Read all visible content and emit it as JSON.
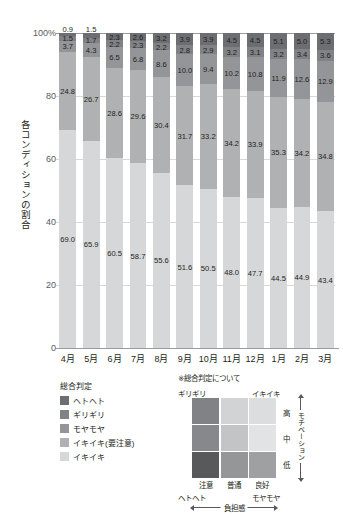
{
  "chart_data": {
    "type": "bar",
    "stacked": true,
    "stack_mode": "percent",
    "title": "",
    "xlabel": "",
    "ylabel": "各コンディションの割合",
    "ylim": [
      0,
      100
    ],
    "yticks": [
      "0",
      "20",
      "40",
      "60",
      "80",
      "100%"
    ],
    "grid": true,
    "legend_position": "below-left",
    "legend_title": "総合判定",
    "categories": [
      "4月",
      "5月",
      "6月",
      "7月",
      "8月",
      "9月",
      "10月",
      "11月",
      "12月",
      "1月",
      "2月",
      "3月"
    ],
    "series": [
      {
        "name": "ヘトヘト",
        "color": "#6d6e71",
        "values": [
          0.9,
          1.5,
          2.3,
          2.6,
          3.2,
          3.9,
          3.9,
          4.5,
          4.5,
          5.1,
          5.0,
          5.3
        ]
      },
      {
        "name": "ギリギリ",
        "color": "#808285",
        "values": [
          1.5,
          1.7,
          2.2,
          2.3,
          2.2,
          2.8,
          2.9,
          3.2,
          3.1,
          3.2,
          3.4,
          3.6
        ]
      },
      {
        "name": "モヤモヤ",
        "color": "#949598",
        "values": [
          3.7,
          4.3,
          6.5,
          6.8,
          8.6,
          10.0,
          9.4,
          10.2,
          10.8,
          11.9,
          12.6,
          12.9
        ]
      },
      {
        "name": "イキイキ(要注意)",
        "color": "#b0b1b3",
        "values": [
          24.8,
          26.7,
          28.6,
          29.6,
          30.4,
          31.7,
          33.2,
          34.2,
          33.9,
          35.3,
          34.2,
          34.8
        ]
      },
      {
        "name": "イキイキ",
        "color": "#d6d7d8",
        "values": [
          69.0,
          65.9,
          60.5,
          58.7,
          55.6,
          51.6,
          50.5,
          48.0,
          47.7,
          44.5,
          44.9,
          43.4
        ]
      }
    ]
  },
  "legend": {
    "title": "総合判定",
    "items": [
      {
        "label": "ヘトヘト",
        "color": "#6d6e71"
      },
      {
        "label": "ギリギリ",
        "color": "#808285"
      },
      {
        "label": "モヤモヤ",
        "color": "#949598"
      },
      {
        "label": "イキイキ(要注意)",
        "color": "#b0b1b3"
      },
      {
        "label": "イキイキ",
        "color": "#d6d7d8"
      }
    ]
  },
  "matrix": {
    "note": "※総合判定について",
    "corner_top_left": "ギリギリ",
    "corner_top_right": "イキイキ",
    "corner_bottom_left": "ヘトヘト",
    "corner_bottom_right": "モヤモヤ",
    "column_labels": [
      "注意",
      "普通",
      "良好"
    ],
    "row_labels": [
      "高",
      "中",
      "低"
    ],
    "vertical_axis_label": "モチベーション",
    "horizontal_axis_label": "負担感",
    "cells": [
      [
        "#808285",
        "#d2d3d5",
        "#dcdddf"
      ],
      [
        "#86888b",
        "#c3c4c6",
        "#e2e3e5"
      ],
      [
        "#58595b",
        "#959698",
        "#9fa0a2"
      ]
    ]
  }
}
